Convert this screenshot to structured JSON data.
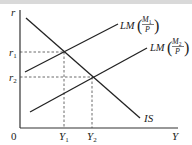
{
  "diagram": {
    "type": "IS-LM",
    "axes": {
      "y_label": "r",
      "x_label": "Y",
      "origin_label": "0"
    },
    "y_ticks": [
      {
        "label": "r",
        "sub": "1"
      },
      {
        "label": "r",
        "sub": "2"
      }
    ],
    "x_ticks": [
      {
        "label": "Y",
        "sub": "1"
      },
      {
        "label": "Y",
        "sub": "2"
      }
    ],
    "curves": {
      "is": {
        "label": "IS"
      },
      "lm1": {
        "prefix": "LM",
        "numerator": "M",
        "num_sub": "1",
        "denominator": "P"
      },
      "lm2": {
        "prefix": "LM",
        "numerator": "M",
        "num_sub": "2",
        "denominator": "P"
      }
    },
    "colors": {
      "line": "#222222",
      "dashed": "#444444",
      "background": "#ffffff"
    }
  }
}
